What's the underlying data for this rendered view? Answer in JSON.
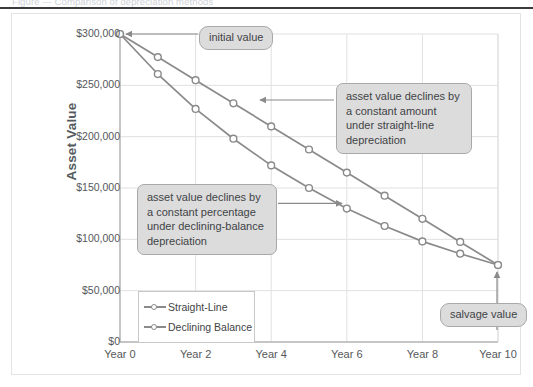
{
  "page": {
    "cut_off_header_text": "Figure — Comparison of depreciation methods"
  },
  "chart_data": {
    "type": "line",
    "title": "",
    "xlabel": "",
    "ylabel": "Asset Value",
    "x": [
      0,
      1,
      2,
      3,
      4,
      5,
      6,
      7,
      8,
      9,
      10
    ],
    "xtick_labels": [
      "Year 0",
      "Year 2",
      "Year 4",
      "Year 6",
      "Year 8",
      "Year 10"
    ],
    "xtick_values": [
      0,
      2,
      4,
      6,
      8,
      10
    ],
    "ytick_labels": [
      "$0",
      "$50,000",
      "$100,000",
      "$150,000",
      "$200,000",
      "$250,000",
      "$300,000"
    ],
    "ytick_values": [
      0,
      50000,
      100000,
      150000,
      200000,
      250000,
      300000
    ],
    "ylim": [
      0,
      300000
    ],
    "xlim": [
      0,
      10
    ],
    "grid": true,
    "legend_position": "inside-lower-left",
    "series": [
      {
        "name": "Straight-Line",
        "color": "#8a8a8a",
        "marker": "open-circle",
        "values": [
          300000,
          277500,
          255000,
          232500,
          210000,
          187500,
          165000,
          142500,
          120000,
          97500,
          75000
        ]
      },
      {
        "name": "Declining Balance",
        "color": "#8a8a8a",
        "marker": "open-circle",
        "values": [
          300000,
          261000,
          227000,
          198000,
          172000,
          150000,
          130000,
          113000,
          98000,
          86000,
          75000
        ]
      }
    ],
    "annotations": [
      {
        "id": "initial-value",
        "text": "initial value",
        "style": "pill",
        "points_to": "Year 0 / $300,000"
      },
      {
        "id": "straight-line-note",
        "text": "asset value declines by a constant amount under straight-line depreciation",
        "style": "box",
        "points_to": "Straight-Line series"
      },
      {
        "id": "declining-balance-note",
        "text": "asset value declines by a constant percentage under declining-balance depreciation",
        "style": "box",
        "points_to": "Declining Balance series"
      },
      {
        "id": "salvage-value",
        "text": "salvage value",
        "style": "pill",
        "points_to": "Year 10 / $75,000"
      }
    ]
  },
  "colors": {
    "line": "#8a8a8a",
    "grid": "#e0e0e0",
    "axis": "#9b9b9b",
    "callout_fill": "#dcdcdc",
    "callout_border": "#a9a9a9",
    "text": "#56585b"
  }
}
